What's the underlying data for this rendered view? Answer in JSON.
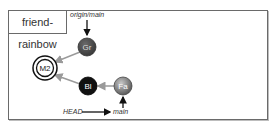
{
  "repo": {
    "name": "friend-rainbow"
  },
  "refs": {
    "origin_main": "origin/main",
    "head": "HEAD",
    "main": "main"
  },
  "commits": [
    {
      "id": "gr",
      "label": "Gr",
      "fill": "#555555",
      "text_color": "#dddddd"
    },
    {
      "id": "m2",
      "label": "M2",
      "fill": "#ffffff",
      "text_color": "#222222",
      "merge": true
    },
    {
      "id": "bl",
      "label": "Bl",
      "fill": "#111111",
      "text_color": "#ffffff"
    },
    {
      "id": "fa",
      "label": "Fa",
      "fill": "#8a8a8a",
      "text_color": "#ffffff"
    }
  ],
  "colors": {
    "edge": "#9a9a9a",
    "pointer": "#111111",
    "frame": "#6a6a6a"
  }
}
